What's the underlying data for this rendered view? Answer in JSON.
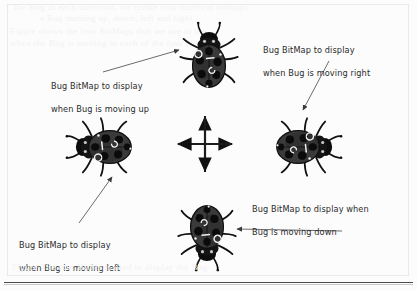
{
  "figure": {
    "background_color": "#fcfcfc",
    "ink_color": "#2b2b2b"
  },
  "ghost_text": [
    "the Bug in each direction, we create four different bitmaps",
    "a Bug moving up, down, left and right.",
    "Figure shows the four BitMaps that we use in the",
    "when the Bug is moving in each of the four directions."
  ],
  "labels": [
    {
      "id": "label-up",
      "line1": "Bug BitMap to display",
      "line2": "when Bug is moving up",
      "direction": "up"
    },
    {
      "id": "label-right",
      "line1": "Bug BitMap to display",
      "line2": "when Bug is moving right",
      "direction": "right"
    },
    {
      "id": "label-left",
      "line1": "Bug BitMap to display",
      "line2": "when Bug is moving left",
      "direction": "left"
    },
    {
      "id": "label-down",
      "line1": "Bug BitMap to display when",
      "line2": "Bug is moving down",
      "direction": "down"
    }
  ],
  "bugs": [
    {
      "id": "bug-up",
      "direction": "up",
      "rotation": 0
    },
    {
      "id": "bug-right",
      "direction": "right",
      "rotation": 90
    },
    {
      "id": "bug-down",
      "direction": "down",
      "rotation": 180
    },
    {
      "id": "bug-left",
      "direction": "left",
      "rotation": 270
    }
  ],
  "compass": {
    "id": "direction-cross",
    "arrows": [
      "up",
      "right",
      "down",
      "left"
    ]
  },
  "leader_lines": [
    {
      "id": "leader-up",
      "from_label": "label-up",
      "to_bug": "bug-up"
    },
    {
      "id": "leader-right",
      "from_label": "label-right",
      "to_bug": "bug-right"
    },
    {
      "id": "leader-left",
      "from_label": "label-left",
      "to_bug": "bug-left"
    },
    {
      "id": "leader-down",
      "from_label": "label-down",
      "to_bug": "bug-down"
    }
  ]
}
